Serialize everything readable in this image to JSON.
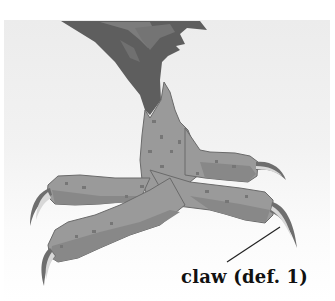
{
  "illustration": {
    "subject": "bird foot with talons",
    "colors": {
      "background_top": "#ececec",
      "background_bottom": "#ffffff",
      "feathers_dark": "#5e5e5e",
      "feathers_mid": "#7a7a7a",
      "leg_light": "#9c9c9c",
      "leg_mid": "#888888",
      "leg_spot": "#767676",
      "outline": "#6a6a6a",
      "claw": "#6e6e6e"
    }
  },
  "callout": {
    "label": "claw (def. 1)"
  }
}
